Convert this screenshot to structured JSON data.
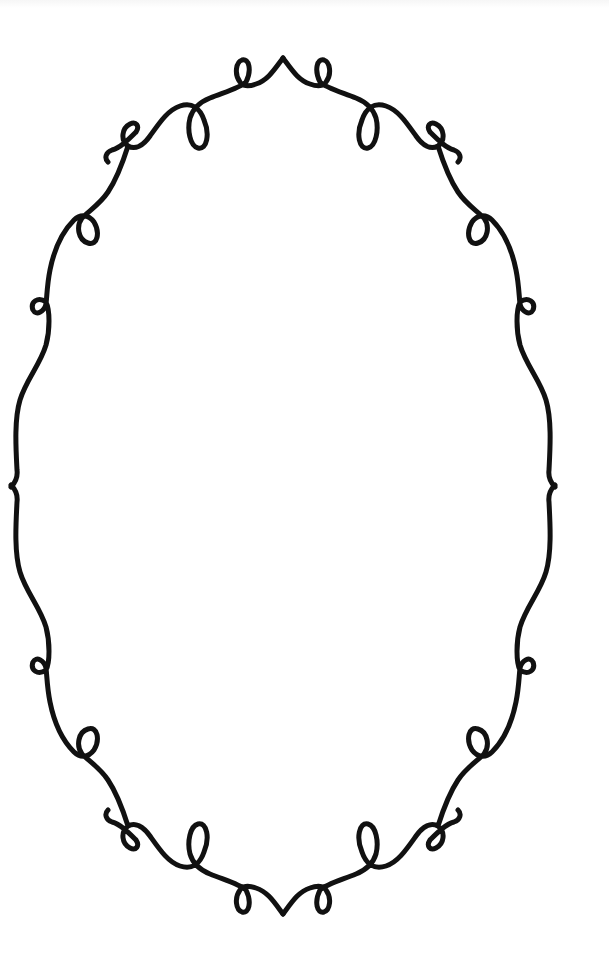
{
  "image": {
    "description": "Decorative ornamental oval frame with curly loops",
    "background_color": "#ffffff",
    "stroke_color": "#111111",
    "stroke_width": 5
  },
  "frame": {
    "shape": "oval",
    "symmetry": [
      "horizontal",
      "vertical"
    ],
    "center": {
      "x": 283,
      "y": 486
    },
    "top_peak": {
      "x": 283,
      "y": 58
    },
    "bottom_valley": {
      "x": 283,
      "y": 913
    },
    "left_apex": {
      "x": 11,
      "y": 487
    },
    "right_apex": {
      "x": 554,
      "y": 487
    },
    "ornaments": [
      {
        "name": "top-left-small-loop",
        "x": 242,
        "y": 72
      },
      {
        "name": "top-right-small-loop",
        "x": 323,
        "y": 72
      },
      {
        "name": "upper-left-drop-loop",
        "x": 197,
        "y": 128
      },
      {
        "name": "upper-right-drop-loop",
        "x": 368,
        "y": 128
      },
      {
        "name": "upper-left-curl",
        "x": 125,
        "y": 140
      },
      {
        "name": "upper-right-curl",
        "x": 440,
        "y": 140
      },
      {
        "name": "left-shoulder-loop",
        "x": 88,
        "y": 228
      },
      {
        "name": "right-shoulder-loop",
        "x": 478,
        "y": 228
      },
      {
        "name": "left-upper-side-loop",
        "x": 40,
        "y": 310
      },
      {
        "name": "right-upper-side-loop",
        "x": 526,
        "y": 306
      },
      {
        "name": "left-lower-side-loop",
        "x": 40,
        "y": 666
      },
      {
        "name": "right-lower-side-loop",
        "x": 526,
        "y": 664
      },
      {
        "name": "left-hip-loop",
        "x": 88,
        "y": 745
      },
      {
        "name": "right-hip-loop",
        "x": 478,
        "y": 745
      },
      {
        "name": "lower-left-curl",
        "x": 125,
        "y": 832
      },
      {
        "name": "lower-right-curl",
        "x": 440,
        "y": 832
      },
      {
        "name": "lower-left-rise-loop",
        "x": 197,
        "y": 840
      },
      {
        "name": "lower-right-rise-loop",
        "x": 368,
        "y": 840
      },
      {
        "name": "bottom-left-small-loop",
        "x": 242,
        "y": 900
      },
      {
        "name": "bottom-right-small-loop",
        "x": 323,
        "y": 900
      }
    ]
  }
}
